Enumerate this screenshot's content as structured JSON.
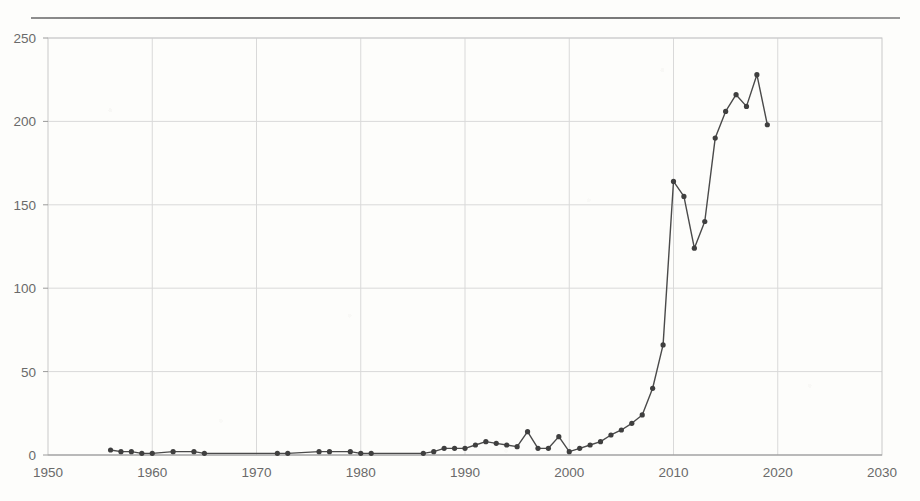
{
  "figure": {
    "top_rule": true,
    "background_color": "#fdfdfb"
  },
  "chart_data": {
    "type": "line",
    "title": "",
    "subtitle": "",
    "xlabel": "",
    "ylabel": "",
    "xlim": [
      1950,
      2030
    ],
    "ylim": [
      0,
      250
    ],
    "xticks": [
      1950,
      1960,
      1970,
      1980,
      1990,
      2000,
      2010,
      2020,
      2030
    ],
    "xtick_labels": [
      "1950",
      "1960",
      "1970",
      "1980",
      "1990",
      "2000",
      "2010",
      "2020",
      "2030"
    ],
    "yticks": [
      0,
      50,
      100,
      150,
      200,
      250
    ],
    "ytick_labels": [
      "0",
      "50",
      "100",
      "150",
      "200",
      "250"
    ],
    "grid": true,
    "grid_color": "#d9d9d9",
    "legend": null,
    "legend_position": "none",
    "line_color": "#4a4a4a",
    "marker_color": "#3f3f3f",
    "marker": "circle",
    "marker_size": 4,
    "line_width": 1.4,
    "x": [
      1956,
      1957,
      1958,
      1959,
      1960,
      1962,
      1964,
      1965,
      1972,
      1973,
      1976,
      1977,
      1979,
      1980,
      1981,
      1986,
      1987,
      1988,
      1989,
      1990,
      1991,
      1992,
      1993,
      1994,
      1995,
      1996,
      1997,
      1998,
      1999,
      2000,
      2001,
      2002,
      2003,
      2004,
      2005,
      2006,
      2007,
      2008,
      2009,
      2010,
      2011,
      2012,
      2013,
      2014,
      2015,
      2016,
      2017,
      2018,
      2019
    ],
    "values": [
      3,
      2,
      2,
      1,
      1,
      2,
      2,
      1,
      1,
      1,
      2,
      2,
      2,
      1,
      1,
      1,
      2,
      4,
      4,
      4,
      6,
      8,
      7,
      6,
      5,
      14,
      4,
      4,
      11,
      2,
      4,
      6,
      8,
      12,
      15,
      19,
      24,
      40,
      66,
      164,
      155,
      124,
      140,
      190,
      206,
      216,
      209,
      228,
      198
    ],
    "series": [
      {
        "name": "count",
        "values": [
          3,
          2,
          2,
          1,
          1,
          2,
          2,
          1,
          1,
          1,
          2,
          2,
          2,
          1,
          1,
          1,
          2,
          4,
          4,
          4,
          6,
          8,
          7,
          6,
          5,
          14,
          4,
          4,
          11,
          2,
          4,
          6,
          8,
          12,
          15,
          19,
          24,
          40,
          66,
          164,
          155,
          124,
          140,
          190,
          206,
          216,
          209,
          228,
          198
        ]
      }
    ],
    "annotations": []
  }
}
